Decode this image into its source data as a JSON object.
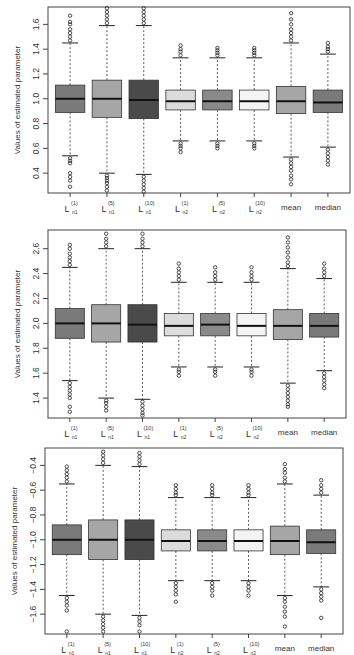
{
  "chart_data": [
    {
      "type": "boxplot",
      "title": "",
      "xlabel": "",
      "ylabel": "Values of estimated parameter",
      "ylim": [
        0.24,
        1.74
      ],
      "yticks": [
        0.4,
        0.6,
        0.8,
        1.0,
        1.2,
        1.4,
        1.6
      ],
      "ytick_labels": [
        "0.4",
        "0.6",
        "0.8",
        "1.0",
        "1.2",
        "1.4",
        "1.6"
      ],
      "grid": false,
      "legend": null,
      "frame": {
        "x": 48,
        "y": 7,
        "w": 302,
        "h": 186
      },
      "categories": [
        {
          "main": "L",
          "sup": "(1)",
          "sub": "n1"
        },
        {
          "main": "L",
          "sup": "(5)",
          "sub": "n1"
        },
        {
          "main": "L",
          "sup": "(10)",
          "sub": "n1"
        },
        {
          "main": "L",
          "sup": "(1)",
          "sub": "n2"
        },
        {
          "main": "L",
          "sup": "(5)",
          "sub": "n2"
        },
        {
          "main": "L",
          "sup": "(10)",
          "sub": "n2"
        },
        {
          "main": "mean",
          "sup": "",
          "sub": ""
        },
        {
          "main": "median",
          "sup": "",
          "sub": ""
        }
      ],
      "boxes": [
        {
          "label": "L(1)n1",
          "fill": "#7a7a7a",
          "whisker_low": 0.54,
          "q1": 0.89,
          "median": 1.0,
          "q3": 1.11,
          "whisker_high": 1.45,
          "outliers_low": [
            0.52,
            0.5,
            0.48,
            0.4,
            0.37,
            0.34,
            0.29
          ],
          "outliers_high": [
            1.47,
            1.5,
            1.53,
            1.56,
            1.6,
            1.62,
            1.67
          ]
        },
        {
          "label": "L(5)n1",
          "fill": "#a6a6a6",
          "whisker_low": 0.4,
          "q1": 0.85,
          "median": 1.0,
          "q3": 1.15,
          "whisker_high": 1.59,
          "outliers_low": [
            0.38,
            0.36,
            0.34,
            0.32,
            0.29,
            0.26
          ],
          "outliers_high": [
            1.61,
            1.64,
            1.67,
            1.7,
            1.73
          ]
        },
        {
          "label": "L(10)n1",
          "fill": "#4a4a4a",
          "whisker_low": 0.39,
          "q1": 0.84,
          "median": 0.99,
          "q3": 1.15,
          "whisker_high": 1.59,
          "outliers_low": [
            0.37,
            0.34,
            0.31,
            0.28,
            0.25
          ],
          "outliers_high": [
            1.61,
            1.64,
            1.67,
            1.7,
            1.73
          ]
        },
        {
          "label": "L(1)n2",
          "fill": "#dcdcdc",
          "whisker_low": 0.66,
          "q1": 0.91,
          "median": 0.98,
          "q3": 1.07,
          "whisker_high": 1.33,
          "outliers_low": [
            0.64,
            0.62,
            0.6,
            0.57
          ],
          "outliers_high": [
            1.35,
            1.38,
            1.4,
            1.43
          ]
        },
        {
          "label": "L(5)n2",
          "fill": "#8a8a8a",
          "whisker_low": 0.66,
          "q1": 0.91,
          "median": 0.98,
          "q3": 1.07,
          "whisker_high": 1.33,
          "outliers_low": [
            0.64,
            0.62,
            0.6
          ],
          "outliers_high": [
            1.35,
            1.37,
            1.39,
            1.41
          ]
        },
        {
          "label": "L(10)n2",
          "fill": "#f4f4f4",
          "whisker_low": 0.66,
          "q1": 0.91,
          "median": 0.98,
          "q3": 1.07,
          "whisker_high": 1.33,
          "outliers_low": [
            0.64,
            0.62,
            0.6
          ],
          "outliers_high": [
            1.35,
            1.37,
            1.39,
            1.41
          ]
        },
        {
          "label": "mean",
          "fill": "#a6a6a6",
          "whisker_low": 0.53,
          "q1": 0.88,
          "median": 0.98,
          "q3": 1.1,
          "whisker_high": 1.45,
          "outliers_low": [
            0.51,
            0.48,
            0.45,
            0.42,
            0.38,
            0.35,
            0.31
          ],
          "outliers_high": [
            1.47,
            1.5,
            1.53,
            1.56,
            1.6,
            1.64,
            1.69
          ]
        },
        {
          "label": "median",
          "fill": "#7a7a7a",
          "whisker_low": 0.61,
          "q1": 0.89,
          "median": 0.97,
          "q3": 1.07,
          "whisker_high": 1.36,
          "outliers_low": [
            0.59,
            0.56,
            0.53,
            0.5,
            0.47
          ],
          "outliers_high": [
            1.38,
            1.4,
            1.42,
            1.45
          ]
        }
      ]
    },
    {
      "type": "boxplot",
      "title": "",
      "xlabel": "",
      "ylabel": "Values of estimated parameter",
      "ylim": [
        1.24,
        2.75
      ],
      "yticks": [
        1.4,
        1.6,
        1.8,
        2.0,
        2.2,
        2.4,
        2.6
      ],
      "ytick_labels": [
        "1.4",
        "1.6",
        "1.8",
        "2.0",
        "2.2",
        "2.4",
        "2.6"
      ],
      "grid": false,
      "legend": null,
      "frame": {
        "x": 48,
        "y": 230,
        "w": 298,
        "h": 188
      },
      "categories": [
        {
          "main": "L",
          "sup": "(1)",
          "sub": "n1"
        },
        {
          "main": "L",
          "sup": "(5)",
          "sub": "n1"
        },
        {
          "main": "L",
          "sup": "(10)",
          "sub": "n1"
        },
        {
          "main": "L",
          "sup": "(1)",
          "sub": "n2"
        },
        {
          "main": "L",
          "sup": "(5)",
          "sub": "n2"
        },
        {
          "main": "L",
          "sup": "(10)",
          "sub": "n2"
        },
        {
          "main": "mean",
          "sup": "",
          "sub": ""
        },
        {
          "main": "median",
          "sup": "",
          "sub": ""
        }
      ],
      "boxes": [
        {
          "label": "L(1)n1",
          "fill": "#7a7a7a",
          "whisker_low": 1.54,
          "q1": 1.88,
          "median": 2.0,
          "q3": 2.12,
          "whisker_high": 2.45,
          "outliers_low": [
            1.52,
            1.49,
            1.46,
            1.43,
            1.4,
            1.33,
            1.29
          ],
          "outliers_high": [
            2.47,
            2.5,
            2.53,
            2.56,
            2.6,
            2.63
          ]
        },
        {
          "label": "L(5)n1",
          "fill": "#a6a6a6",
          "whisker_low": 1.4,
          "q1": 1.85,
          "median": 2.0,
          "q3": 2.15,
          "whisker_high": 2.6,
          "outliers_low": [
            1.38,
            1.36,
            1.33,
            1.3
          ],
          "outliers_high": [
            2.62,
            2.65,
            2.68,
            2.72
          ]
        },
        {
          "label": "L(10)n1",
          "fill": "#4a4a4a",
          "whisker_low": 1.39,
          "q1": 1.85,
          "median": 1.99,
          "q3": 2.15,
          "whisker_high": 2.6,
          "outliers_low": [
            1.37,
            1.34,
            1.31,
            1.28,
            1.26
          ],
          "outliers_high": [
            2.62,
            2.65,
            2.68,
            2.72
          ]
        },
        {
          "label": "L(1)n2",
          "fill": "#dcdcdc",
          "whisker_low": 1.65,
          "q1": 1.9,
          "median": 1.98,
          "q3": 2.08,
          "whisker_high": 2.33,
          "outliers_low": [
            1.63,
            1.61,
            1.58
          ],
          "outliers_high": [
            2.35,
            2.38,
            2.41,
            2.44,
            2.48
          ]
        },
        {
          "label": "L(5)n2",
          "fill": "#8a8a8a",
          "whisker_low": 1.65,
          "q1": 1.9,
          "median": 1.99,
          "q3": 2.08,
          "whisker_high": 2.33,
          "outliers_low": [
            1.63,
            1.61,
            1.58
          ],
          "outliers_high": [
            2.35,
            2.38,
            2.41,
            2.45
          ]
        },
        {
          "label": "L(10)n2",
          "fill": "#f4f4f4",
          "whisker_low": 1.65,
          "q1": 1.9,
          "median": 1.98,
          "q3": 2.08,
          "whisker_high": 2.33,
          "outliers_low": [
            1.63,
            1.61,
            1.58
          ],
          "outliers_high": [
            2.35,
            2.38,
            2.41,
            2.45
          ]
        },
        {
          "label": "mean",
          "fill": "#a6a6a6",
          "whisker_low": 1.52,
          "q1": 1.87,
          "median": 1.98,
          "q3": 2.11,
          "whisker_high": 2.44,
          "outliers_low": [
            1.5,
            1.47,
            1.44,
            1.41,
            1.38,
            1.35,
            1.33
          ],
          "outliers_high": [
            2.46,
            2.49,
            2.53,
            2.57,
            2.61,
            2.65,
            2.69
          ]
        },
        {
          "label": "median",
          "fill": "#7a7a7a",
          "whisker_low": 1.62,
          "q1": 1.89,
          "median": 1.98,
          "q3": 2.08,
          "whisker_high": 2.36,
          "outliers_low": [
            1.6,
            1.57,
            1.54,
            1.51,
            1.48
          ],
          "outliers_high": [
            2.38,
            2.41,
            2.44,
            2.48
          ]
        }
      ]
    },
    {
      "type": "boxplot",
      "title": "",
      "xlabel": "",
      "ylabel": "Values of estimated parameter",
      "ylim": [
        -1.76,
        -0.26
      ],
      "yticks": [
        -1.6,
        -1.4,
        -1.2,
        -1.0,
        -0.8,
        -0.6,
        -0.4
      ],
      "ytick_labels": [
        "-1.6",
        "-1.4",
        "-1.2",
        "-1.0",
        "-0.8",
        "-0.6",
        "-0.4"
      ],
      "grid": false,
      "legend": null,
      "frame": {
        "x": 45,
        "y": 448,
        "w": 298,
        "h": 186
      },
      "categories": [
        {
          "main": "L",
          "sup": "(1)",
          "sub": "n1"
        },
        {
          "main": "L",
          "sup": "(5)",
          "sub": "n1"
        },
        {
          "main": "L",
          "sup": "(10)",
          "sub": "n1"
        },
        {
          "main": "L",
          "sup": "(1)",
          "sub": "n2"
        },
        {
          "main": "L",
          "sup": "(5)",
          "sub": "n2"
        },
        {
          "main": "L",
          "sup": "(10)",
          "sub": "n2"
        },
        {
          "main": "mean",
          "sup": "",
          "sub": ""
        },
        {
          "main": "median",
          "sup": "",
          "sub": ""
        }
      ],
      "boxes": [
        {
          "label": "L(1)n1",
          "fill": "#7a7a7a",
          "whisker_low": -1.45,
          "q1": -1.12,
          "median": -1.0,
          "q3": -0.88,
          "whisker_high": -0.55,
          "outliers_low": [
            -1.47,
            -1.5,
            -1.53,
            -1.57,
            -1.74
          ],
          "outliers_high": [
            -0.53,
            -0.5,
            -0.47,
            -0.44,
            -0.41
          ]
        },
        {
          "label": "L(5)n1",
          "fill": "#a6a6a6",
          "whisker_low": -1.6,
          "q1": -1.16,
          "median": -1.0,
          "q3": -0.84,
          "whisker_high": -0.4,
          "outliers_low": [
            -1.62,
            -1.65,
            -1.68,
            -1.71,
            -1.74
          ],
          "outliers_high": [
            -0.38,
            -0.35,
            -0.32,
            -0.29
          ]
        },
        {
          "label": "L(10)n1",
          "fill": "#4a4a4a",
          "whisker_low": -1.61,
          "q1": -1.16,
          "median": -1.0,
          "q3": -0.84,
          "whisker_high": -0.41,
          "outliers_low": [
            -1.63,
            -1.66,
            -1.69,
            -1.74
          ],
          "outliers_high": [
            -0.39,
            -0.36,
            -0.33,
            -0.3
          ]
        },
        {
          "label": "L(1)n2",
          "fill": "#dcdcdc",
          "whisker_low": -1.33,
          "q1": -1.09,
          "median": -1.01,
          "q3": -0.92,
          "whisker_high": -0.66,
          "outliers_low": [
            -1.35,
            -1.38,
            -1.41,
            -1.44,
            -1.5
          ],
          "outliers_high": [
            -0.64,
            -0.62,
            -0.59,
            -0.56
          ]
        },
        {
          "label": "L(5)n2",
          "fill": "#8a8a8a",
          "whisker_low": -1.33,
          "q1": -1.09,
          "median": -1.01,
          "q3": -0.92,
          "whisker_high": -0.66,
          "outliers_low": [
            -1.35,
            -1.38,
            -1.41,
            -1.45
          ],
          "outliers_high": [
            -0.64,
            -0.62,
            -0.59,
            -0.56
          ]
        },
        {
          "label": "L(10)n2",
          "fill": "#f4f4f4",
          "whisker_low": -1.33,
          "q1": -1.09,
          "median": -1.01,
          "q3": -0.92,
          "whisker_high": -0.66,
          "outliers_low": [
            -1.35,
            -1.38,
            -1.41,
            -1.45
          ],
          "outliers_high": [
            -0.64,
            -0.62,
            -0.59,
            -0.56
          ]
        },
        {
          "label": "mean",
          "fill": "#a6a6a6",
          "whisker_low": -1.45,
          "q1": -1.12,
          "median": -1.01,
          "q3": -0.89,
          "whisker_high": -0.55,
          "outliers_low": [
            -1.47,
            -1.5,
            -1.54,
            -1.58,
            -1.62,
            -1.7
          ],
          "outliers_high": [
            -0.53,
            -0.5,
            -0.46,
            -0.43,
            -0.39
          ]
        },
        {
          "label": "median",
          "fill": "#7a7a7a",
          "whisker_low": -1.38,
          "q1": -1.11,
          "median": -1.02,
          "q3": -0.92,
          "whisker_high": -0.64,
          "outliers_low": [
            -1.4,
            -1.43,
            -1.46,
            -1.49,
            -1.63
          ],
          "outliers_high": [
            -0.62,
            -0.59,
            -0.56,
            -0.52
          ]
        }
      ]
    }
  ]
}
